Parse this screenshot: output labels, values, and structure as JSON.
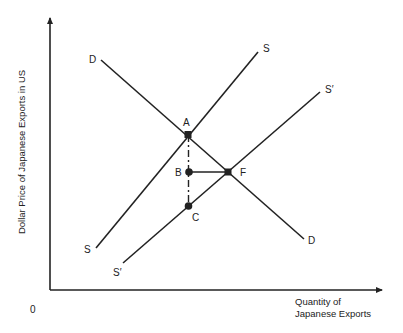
{
  "diagram": {
    "type": "supply-demand",
    "y_axis_label": "Dollar Price of Japanese Exports in US",
    "x_axis_label_line1": "Quantity of",
    "x_axis_label_line2": "Japanese Exports",
    "origin_label": "0",
    "curves": {
      "demand": {
        "start_label": "D",
        "end_label": "D"
      },
      "supply": {
        "start_label": "S",
        "end_label": "S"
      },
      "supply_shifted": {
        "start_label": "S′",
        "end_label": "S′"
      }
    },
    "points": {
      "A": "A",
      "B": "B",
      "C": "C",
      "F": "F"
    },
    "colors": {
      "line": "#222222",
      "background": "#ffffff"
    }
  }
}
